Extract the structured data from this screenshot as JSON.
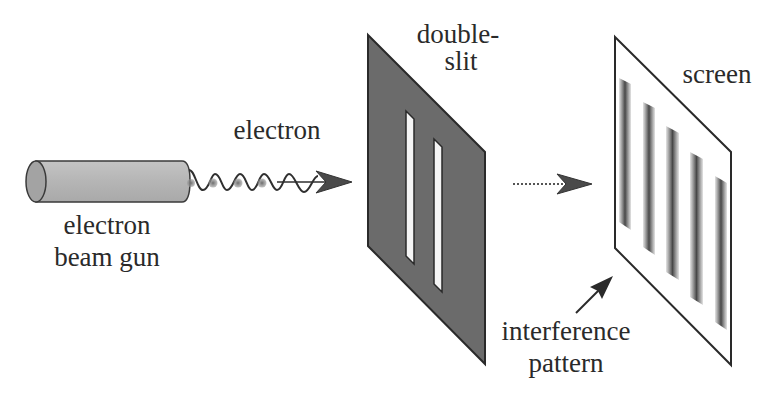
{
  "diagram": {
    "labels": {
      "gun_line1": "electron",
      "gun_line2": "beam gun",
      "electron": "electron",
      "slit_line1": "double-",
      "slit_line2": "slit",
      "screen": "screen",
      "pattern_line1": "interference",
      "pattern_line2": "pattern"
    },
    "components": [
      {
        "id": "electron-beam-gun",
        "shape": "cylinder"
      },
      {
        "id": "electron-wave",
        "shape": "sine wave with particles",
        "particle_count": 3
      },
      {
        "id": "double-slit-plate",
        "shape": "parallelogram",
        "slits": 2
      },
      {
        "id": "propagation-arrow",
        "style": "dotted"
      },
      {
        "id": "screen",
        "shape": "parallelogram",
        "fringe_count": 5
      },
      {
        "id": "pattern-pointer",
        "style": "solid arrow"
      }
    ],
    "colors": {
      "plate": "#6b6b6b",
      "outline": "#2a2a2a",
      "gun_body": "#b8b8b8",
      "gun_cap": "#a6a6a6",
      "fringe": "#4a4a4a",
      "particle": "#8a8a8a",
      "text": "#2a2a2a"
    }
  }
}
